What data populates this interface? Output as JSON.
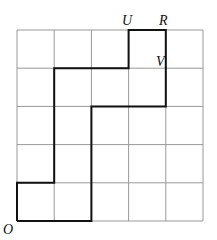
{
  "diagram": {
    "grid": {
      "cols": 5,
      "rows": 5,
      "x0": 17,
      "y0": 30,
      "cell_w": 37.2,
      "cell_h": 38.2,
      "line_color": "#999999"
    },
    "path": {
      "color": "#111111",
      "points": [
        [
          0,
          0
        ],
        [
          2,
          0
        ],
        [
          2,
          3
        ],
        [
          4,
          3
        ],
        [
          4,
          5
        ],
        [
          3,
          5
        ],
        [
          3,
          4
        ],
        [
          1,
          4
        ],
        [
          1,
          1
        ],
        [
          0,
          1
        ],
        [
          0,
          0
        ]
      ]
    },
    "labels": [
      {
        "id": "O",
        "text": "O",
        "x": 3,
        "y": 234
      },
      {
        "id": "U",
        "text": "U",
        "x": 122,
        "y": 25
      },
      {
        "id": "R",
        "text": "R",
        "x": 159,
        "y": 25
      },
      {
        "id": "V",
        "text": "V",
        "x": 156,
        "y": 66
      }
    ]
  }
}
